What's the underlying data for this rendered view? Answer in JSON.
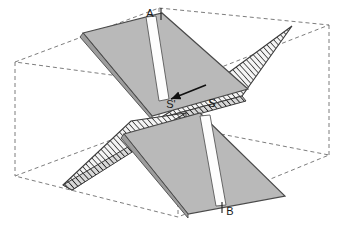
{
  "figure": {
    "width": 346,
    "height": 243,
    "background_color": "#ffffff"
  },
  "colors": {
    "plane_fill": "#b9b9b9",
    "plane_fill_dark": "#9a9a9a",
    "plane_edge": "#4a4a4a",
    "stripe_fill": "#fdfdfd",
    "hatch_line": "#2b2b2b",
    "hatch_background": "#f2f2f2",
    "box_dashed": "#7d7d7d",
    "label_color": "#1a1a1a"
  },
  "labels": [
    {
      "id": "label-a",
      "text": "A",
      "x": 152,
      "y": 14
    },
    {
      "id": "label-s-prime",
      "text": "S'",
      "x": 171,
      "y": 105
    },
    {
      "id": "label-s",
      "text": "S",
      "x": 212,
      "y": 104
    },
    {
      "id": "label-b",
      "text": "B",
      "x": 229,
      "y": 212
    }
  ],
  "tick_marks": {
    "a_tick": {
      "x1": 161,
      "y1": 9,
      "x2": 161,
      "y2": 19
    },
    "b_tick": {
      "x1": 222,
      "y1": 203,
      "x2": 222,
      "y2": 213
    }
  },
  "box": {
    "name": "dashed-bounding-box",
    "dash_pattern": "4,3",
    "top_face": [
      [
        15,
        62
      ],
      [
        159,
        8
      ],
      [
        329,
        25
      ],
      [
        178,
        84
      ]
    ],
    "bottom_face": [
      [
        15,
        176
      ],
      [
        159,
        122
      ],
      [
        329,
        155
      ],
      [
        178,
        217
      ]
    ],
    "verticals": [
      [
        [
          15,
          62
        ],
        [
          15,
          176
        ]
      ],
      [
        [
          159,
          8
        ],
        [
          159,
          122
        ]
      ],
      [
        [
          329,
          25
        ],
        [
          329,
          155
        ]
      ],
      [
        [
          178,
          84
        ],
        [
          178,
          217
        ]
      ]
    ]
  },
  "planes": [
    {
      "name": "upper-left-plane",
      "points": [
        [
          83,
          33
        ],
        [
          162,
          13
        ],
        [
          248,
          89
        ],
        [
          152,
          116
        ]
      ],
      "stripe": [
        [
          147,
          18
        ],
        [
          156,
          17
        ],
        [
          168,
          98
        ],
        [
          159,
          100
        ]
      ]
    },
    {
      "name": "lower-right-plane",
      "points": [
        [
          124,
          134
        ],
        [
          200,
          113
        ],
        [
          285,
          196
        ],
        [
          188,
          214
        ]
      ],
      "stripe": [
        [
          201,
          116
        ],
        [
          210,
          115
        ],
        [
          225,
          205
        ],
        [
          215,
          206
        ]
      ]
    }
  ],
  "hatched_regions": [
    {
      "name": "upper-right-wedge",
      "points": [
        [
          160,
          118
        ],
        [
          205,
          90
        ],
        [
          292,
          26
        ],
        [
          242,
          96
        ]
      ],
      "label": "upper hatched triangular wedge"
    },
    {
      "name": "lower-left-wedge",
      "points": [
        [
          63,
          185
        ],
        [
          130,
          122
        ],
        [
          184,
          114
        ],
        [
          70,
          189
        ]
      ],
      "label": "lower hatched triangular wedge"
    }
  ],
  "arrow": {
    "name": "intersection-arrow",
    "from": [
      206,
      86
    ],
    "to": [
      168,
      100
    ]
  }
}
